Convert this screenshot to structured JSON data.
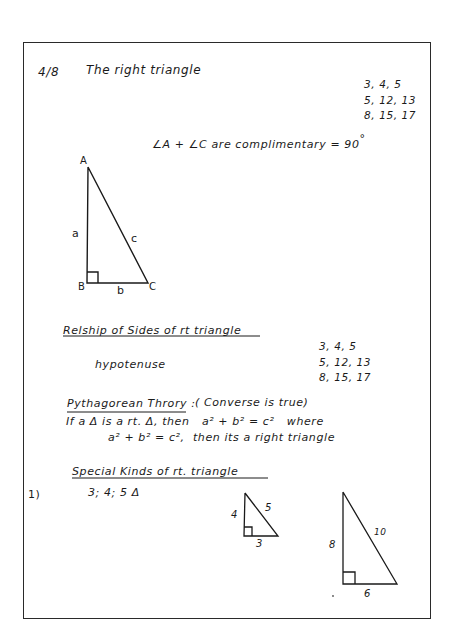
{
  "header": {
    "date": "4/8",
    "title": "The right triangle"
  },
  "triples_top": [
    "3, 4, 5",
    "5, 12, 13",
    "8, 15, 17"
  ],
  "complementary_note": {
    "text": "∠A + ∠C are complimentary = 90",
    "degree": "°"
  },
  "main_triangle": {
    "vertices": {
      "A": "A",
      "B": "B",
      "C": "C"
    },
    "sides": {
      "vertical": "a",
      "base": "b",
      "hypotenuse": "c"
    }
  },
  "relationship_section": {
    "heading": "Relship of Sides of rt triangle",
    "term": "hypotenuse",
    "triples": [
      "3, 4, 5",
      "5, 12, 13",
      "8, 15, 17"
    ]
  },
  "pythagorean_section": {
    "heading": "Pythagorean Throry :",
    "aside": "( Converse is true)",
    "line1_prefix": "If a Δ is a rt. Δ, then",
    "line1_eq": "a² + b² = c²",
    "line1_suffix": "where",
    "line2_eq": "a² + b² = c²,",
    "line2_suffix": "then its a right triangle"
  },
  "special_section": {
    "heading": "Special Kinds of rt. triangle",
    "item_number": "1)",
    "item_text": "3; 4; 5  Δ",
    "small_triangle": {
      "vertical": "4",
      "base": "3",
      "hypotenuse": "5"
    },
    "large_triangle": {
      "vertical": "8",
      "base": "6",
      "hypotenuse": "10"
    }
  }
}
